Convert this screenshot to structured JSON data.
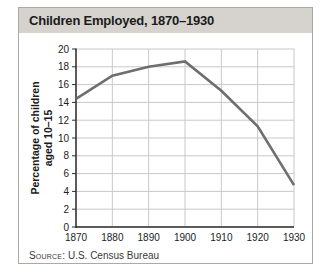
{
  "card": {
    "title": "Children Employed, 1870–1930",
    "source_prefix": "Source:",
    "source_text": "U.S. Census Bureau"
  },
  "chart_data": {
    "type": "line",
    "title": "Children Employed, 1870–1930",
    "categories": [
      "1870",
      "1880",
      "1890",
      "1900",
      "1910",
      "1920",
      "1930"
    ],
    "values": [
      14.4,
      17.0,
      18.0,
      18.6,
      15.3,
      11.3,
      4.7
    ],
    "xlabel": "",
    "ylabel": "Percentage of children aged 10–15",
    "ylabel_lines": [
      "Percentage of children",
      "aged 10–15"
    ],
    "ylim": [
      0,
      20
    ],
    "ytick_step": 2,
    "grid": true,
    "legend": "none",
    "source": "Source: U.S. Census Bureau"
  },
  "colors": {
    "titlebar_bg": "#d6d3ce",
    "card_border": "#aaa9a5",
    "grid": "#c8c8c8",
    "axis": "#2e2e2e",
    "line": "#6e6e6e",
    "text": "#1c1c1c"
  }
}
